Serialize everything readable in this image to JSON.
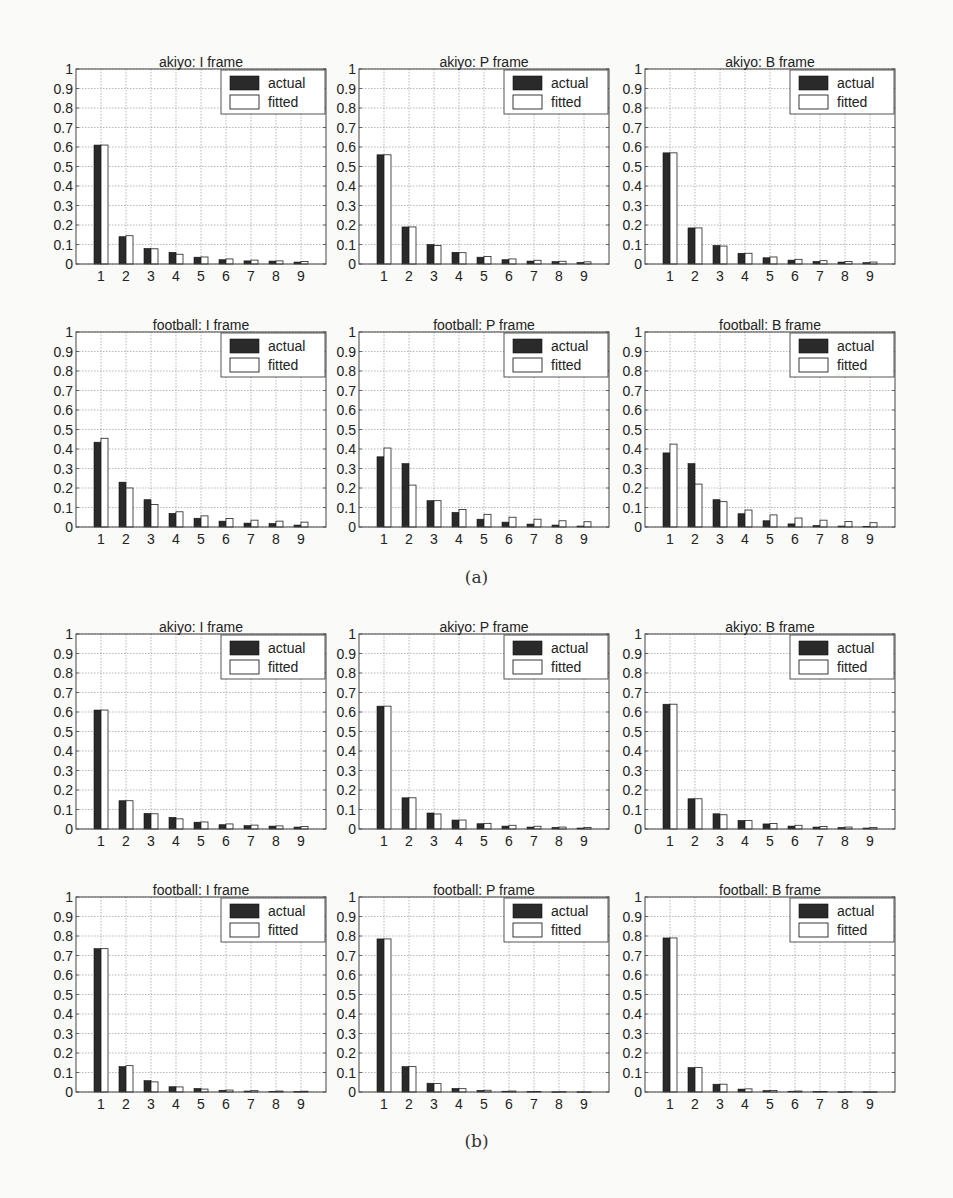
{
  "figure": {
    "captions": [
      "(a)",
      "(b)"
    ],
    "legend": {
      "actual": "actual",
      "fitted": "fitted"
    },
    "colors": {
      "actual": "#2a2a2a",
      "fitted": "#ffffff",
      "grid": "#9a9a9a",
      "axis": "#444444"
    }
  },
  "chart_data": [
    {
      "type": "bar",
      "group": "(a)",
      "title": "akiyo: I frame",
      "categories": [
        "1",
        "2",
        "3",
        "4",
        "5",
        "6",
        "7",
        "8",
        "9"
      ],
      "series": [
        {
          "name": "actual",
          "values": [
            0.61,
            0.14,
            0.08,
            0.06,
            0.035,
            0.022,
            0.016,
            0.015,
            0.01
          ]
        },
        {
          "name": "fitted",
          "values": [
            0.61,
            0.145,
            0.078,
            0.05,
            0.036,
            0.026,
            0.02,
            0.016,
            0.013
          ]
        }
      ],
      "xlabel": "",
      "ylabel": "",
      "ylim": [
        0,
        1
      ],
      "yticks": [
        0,
        0.1,
        0.2,
        0.3,
        0.4,
        0.5,
        0.6,
        0.7,
        0.8,
        0.9,
        1
      ],
      "grid": true,
      "legend_position": "upper right"
    },
    {
      "type": "bar",
      "group": "(a)",
      "title": "akiyo: P frame",
      "categories": [
        "1",
        "2",
        "3",
        "4",
        "5",
        "6",
        "7",
        "8",
        "9"
      ],
      "series": [
        {
          "name": "actual",
          "values": [
            0.56,
            0.19,
            0.1,
            0.06,
            0.035,
            0.022,
            0.015,
            0.012,
            0.008
          ]
        },
        {
          "name": "fitted",
          "values": [
            0.56,
            0.19,
            0.095,
            0.058,
            0.038,
            0.026,
            0.019,
            0.014,
            0.011
          ]
        }
      ],
      "xlabel": "",
      "ylabel": "",
      "ylim": [
        0,
        1
      ],
      "yticks": [
        0,
        0.1,
        0.2,
        0.3,
        0.4,
        0.5,
        0.6,
        0.7,
        0.8,
        0.9,
        1
      ],
      "grid": true,
      "legend_position": "upper right"
    },
    {
      "type": "bar",
      "group": "(a)",
      "title": "akiyo: B frame",
      "categories": [
        "1",
        "2",
        "3",
        "4",
        "5",
        "6",
        "7",
        "8",
        "9"
      ],
      "series": [
        {
          "name": "actual",
          "values": [
            0.57,
            0.185,
            0.095,
            0.055,
            0.032,
            0.02,
            0.013,
            0.01,
            0.007
          ]
        },
        {
          "name": "fitted",
          "values": [
            0.57,
            0.185,
            0.092,
            0.055,
            0.036,
            0.024,
            0.017,
            0.013,
            0.01
          ]
        }
      ],
      "xlabel": "",
      "ylabel": "",
      "ylim": [
        0,
        1
      ],
      "yticks": [
        0,
        0.1,
        0.2,
        0.3,
        0.4,
        0.5,
        0.6,
        0.7,
        0.8,
        0.9,
        1
      ],
      "grid": true,
      "legend_position": "upper right"
    },
    {
      "type": "bar",
      "group": "(a)",
      "title": "football: I frame",
      "categories": [
        "1",
        "2",
        "3",
        "4",
        "5",
        "6",
        "7",
        "8",
        "9"
      ],
      "series": [
        {
          "name": "actual",
          "values": [
            0.435,
            0.23,
            0.14,
            0.07,
            0.045,
            0.03,
            0.02,
            0.018,
            0.01
          ]
        },
        {
          "name": "fitted",
          "values": [
            0.455,
            0.2,
            0.115,
            0.078,
            0.057,
            0.044,
            0.035,
            0.03,
            0.025
          ]
        }
      ],
      "xlabel": "",
      "ylabel": "",
      "ylim": [
        0,
        1
      ],
      "yticks": [
        0,
        0.1,
        0.2,
        0.3,
        0.4,
        0.5,
        0.6,
        0.7,
        0.8,
        0.9,
        1
      ],
      "grid": true,
      "legend_position": "upper right"
    },
    {
      "type": "bar",
      "group": "(a)",
      "title": "football: P frame",
      "categories": [
        "1",
        "2",
        "3",
        "4",
        "5",
        "6",
        "7",
        "8",
        "9"
      ],
      "series": [
        {
          "name": "actual",
          "values": [
            0.36,
            0.325,
            0.135,
            0.075,
            0.04,
            0.025,
            0.015,
            0.01,
            0.005
          ]
        },
        {
          "name": "fitted",
          "values": [
            0.405,
            0.215,
            0.135,
            0.09,
            0.065,
            0.05,
            0.04,
            0.032,
            0.027
          ]
        }
      ],
      "xlabel": "",
      "ylabel": "",
      "ylim": [
        0,
        1
      ],
      "yticks": [
        0,
        0.1,
        0.2,
        0.3,
        0.4,
        0.5,
        0.6,
        0.7,
        0.8,
        0.9,
        1
      ],
      "grid": true,
      "legend_position": "upper right"
    },
    {
      "type": "bar",
      "group": "(a)",
      "title": "football: B frame",
      "categories": [
        "1",
        "2",
        "3",
        "4",
        "5",
        "6",
        "7",
        "8",
        "9"
      ],
      "series": [
        {
          "name": "actual",
          "values": [
            0.38,
            0.325,
            0.14,
            0.068,
            0.032,
            0.016,
            0.008,
            0.005,
            0.003
          ]
        },
        {
          "name": "fitted",
          "values": [
            0.425,
            0.22,
            0.13,
            0.087,
            0.062,
            0.046,
            0.035,
            0.028,
            0.022
          ]
        }
      ],
      "xlabel": "",
      "ylabel": "",
      "ylim": [
        0,
        1
      ],
      "yticks": [
        0,
        0.1,
        0.2,
        0.3,
        0.4,
        0.5,
        0.6,
        0.7,
        0.8,
        0.9,
        1
      ],
      "grid": true,
      "legend_position": "upper right"
    },
    {
      "type": "bar",
      "group": "(b)",
      "title": "akiyo: I frame",
      "categories": [
        "1",
        "2",
        "3",
        "4",
        "5",
        "6",
        "7",
        "8",
        "9"
      ],
      "series": [
        {
          "name": "actual",
          "values": [
            0.61,
            0.145,
            0.08,
            0.06,
            0.035,
            0.022,
            0.017,
            0.015,
            0.01
          ]
        },
        {
          "name": "fitted",
          "values": [
            0.61,
            0.145,
            0.078,
            0.052,
            0.036,
            0.026,
            0.02,
            0.016,
            0.013
          ]
        }
      ],
      "xlabel": "",
      "ylabel": "",
      "ylim": [
        0,
        1
      ],
      "yticks": [
        0,
        0.1,
        0.2,
        0.3,
        0.4,
        0.5,
        0.6,
        0.7,
        0.8,
        0.9,
        1
      ],
      "grid": true,
      "legend_position": "upper right"
    },
    {
      "type": "bar",
      "group": "(b)",
      "title": "akiyo: P frame",
      "categories": [
        "1",
        "2",
        "3",
        "4",
        "5",
        "6",
        "7",
        "8",
        "9"
      ],
      "series": [
        {
          "name": "actual",
          "values": [
            0.63,
            0.16,
            0.082,
            0.046,
            0.027,
            0.015,
            0.01,
            0.008,
            0.005
          ]
        },
        {
          "name": "fitted",
          "values": [
            0.63,
            0.16,
            0.077,
            0.046,
            0.029,
            0.019,
            0.014,
            0.01,
            0.008
          ]
        }
      ],
      "xlabel": "",
      "ylabel": "",
      "ylim": [
        0,
        1
      ],
      "yticks": [
        0,
        0.1,
        0.2,
        0.3,
        0.4,
        0.5,
        0.6,
        0.7,
        0.8,
        0.9,
        1
      ],
      "grid": true,
      "legend_position": "upper right"
    },
    {
      "type": "bar",
      "group": "(b)",
      "title": "akiyo: B frame",
      "categories": [
        "1",
        "2",
        "3",
        "4",
        "5",
        "6",
        "7",
        "8",
        "9"
      ],
      "series": [
        {
          "name": "actual",
          "values": [
            0.64,
            0.155,
            0.078,
            0.044,
            0.026,
            0.015,
            0.01,
            0.008,
            0.005
          ]
        },
        {
          "name": "fitted",
          "values": [
            0.64,
            0.155,
            0.073,
            0.043,
            0.028,
            0.019,
            0.013,
            0.01,
            0.008
          ]
        }
      ],
      "xlabel": "",
      "ylabel": "",
      "ylim": [
        0,
        1
      ],
      "yticks": [
        0,
        0.1,
        0.2,
        0.3,
        0.4,
        0.5,
        0.6,
        0.7,
        0.8,
        0.9,
        1
      ],
      "grid": true,
      "legend_position": "upper right"
    },
    {
      "type": "bar",
      "group": "(b)",
      "title": "football: I frame",
      "categories": [
        "1",
        "2",
        "3",
        "4",
        "5",
        "6",
        "7",
        "8",
        "9"
      ],
      "series": [
        {
          "name": "actual",
          "values": [
            0.735,
            0.13,
            0.058,
            0.027,
            0.018,
            0.009,
            0.005,
            0.003,
            0.002
          ]
        },
        {
          "name": "fitted",
          "values": [
            0.735,
            0.135,
            0.052,
            0.026,
            0.015,
            0.01,
            0.007,
            0.005,
            0.004
          ]
        }
      ],
      "xlabel": "",
      "ylabel": "",
      "ylim": [
        0,
        1
      ],
      "yticks": [
        0,
        0.1,
        0.2,
        0.3,
        0.4,
        0.5,
        0.6,
        0.7,
        0.8,
        0.9,
        1
      ],
      "grid": true,
      "legend_position": "upper right"
    },
    {
      "type": "bar",
      "group": "(b)",
      "title": "football: P frame",
      "categories": [
        "1",
        "2",
        "3",
        "4",
        "5",
        "6",
        "7",
        "8",
        "9"
      ],
      "series": [
        {
          "name": "actual",
          "values": [
            0.785,
            0.13,
            0.045,
            0.018,
            0.008,
            0.004,
            0.002,
            0.001,
            0.001
          ]
        },
        {
          "name": "fitted",
          "values": [
            0.785,
            0.13,
            0.043,
            0.017,
            0.009,
            0.005,
            0.003,
            0.002,
            0.001
          ]
        }
      ],
      "xlabel": "",
      "ylabel": "",
      "ylim": [
        0,
        1
      ],
      "yticks": [
        0,
        0.1,
        0.2,
        0.3,
        0.4,
        0.5,
        0.6,
        0.7,
        0.8,
        0.9,
        1
      ],
      "grid": true,
      "legend_position": "upper right"
    },
    {
      "type": "bar",
      "group": "(b)",
      "title": "football: B frame",
      "categories": [
        "1",
        "2",
        "3",
        "4",
        "5",
        "6",
        "7",
        "8",
        "9"
      ],
      "series": [
        {
          "name": "actual",
          "values": [
            0.79,
            0.125,
            0.04,
            0.015,
            0.007,
            0.004,
            0.002,
            0.001,
            0.001
          ]
        },
        {
          "name": "fitted",
          "values": [
            0.79,
            0.125,
            0.04,
            0.016,
            0.008,
            0.005,
            0.003,
            0.002,
            0.001
          ]
        }
      ],
      "xlabel": "",
      "ylabel": "",
      "ylim": [
        0,
        1
      ],
      "yticks": [
        0,
        0.1,
        0.2,
        0.3,
        0.4,
        0.5,
        0.6,
        0.7,
        0.8,
        0.9,
        1
      ],
      "grid": true,
      "legend_position": "upper right"
    }
  ]
}
